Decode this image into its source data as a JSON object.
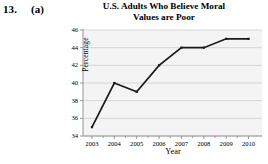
{
  "exercise": {
    "number": "13.",
    "part": "(a)"
  },
  "chart_data": {
    "type": "line",
    "title": "U.S. Adults Who Believe Moral Values are Poor",
    "title_lines": [
      "U.S. Adults Who Believe Moral",
      "Values are Poor"
    ],
    "xlabel": "Year",
    "ylabel": "Percentage",
    "categories": [
      "2003",
      "2004",
      "2005",
      "2006",
      "2007",
      "2008",
      "2009",
      "2010"
    ],
    "x": [
      2003,
      2004,
      2005,
      2006,
      2007,
      2008,
      2009,
      2010
    ],
    "values": [
      35,
      40,
      39,
      42,
      44,
      44,
      45,
      45
    ],
    "xlim": [
      2002.6,
      2010.6
    ],
    "ylim": [
      34,
      46
    ],
    "ytick_labels": [
      "34",
      "36",
      "38",
      "40",
      "42",
      "44",
      "46"
    ],
    "yticks": [
      34,
      36,
      38,
      40,
      42,
      44,
      46
    ],
    "xtick_labels": [
      "2003",
      "2004",
      "2005",
      "2006",
      "2007",
      "2008",
      "2009",
      "2010"
    ],
    "grid": "horizontal",
    "legend": "none",
    "marker": "square",
    "series": [
      {
        "name": "Percentage",
        "values": [
          35,
          40,
          39,
          42,
          44,
          44,
          45,
          45
        ]
      }
    ],
    "colors": {
      "line": "#1a1a1a",
      "marker": "#1a1a1a",
      "panel_background": "#ebebeb",
      "gridline": "#d2d2d2",
      "axis": "#8c8c8c",
      "text": "#000000"
    }
  }
}
